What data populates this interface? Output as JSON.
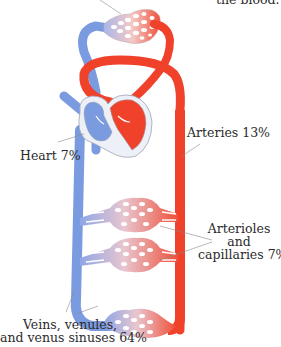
{
  "caption_fragment": "the blood.",
  "labels": {
    "heart": "Heart 7%",
    "arteries": "Arteries 13%",
    "arterioles_line1": "Arterioles",
    "arterioles_line2": "and",
    "arterioles_line3": "capillaries 7%",
    "veins_line1": "Veins, venules,",
    "veins_line2": "and venus sinuses 64%"
  },
  "colors": {
    "arterial": "#f0412b",
    "venous": "#7b9be0",
    "outline": "#9aa3b5",
    "leader": "#8a8a8a"
  },
  "compartments": [
    {
      "name": "Heart",
      "percent": 7
    },
    {
      "name": "Arteries",
      "percent": 13
    },
    {
      "name": "Arterioles and capillaries",
      "percent": 7
    },
    {
      "name": "Veins, venules, and venus sinuses",
      "percent": 64
    }
  ]
}
